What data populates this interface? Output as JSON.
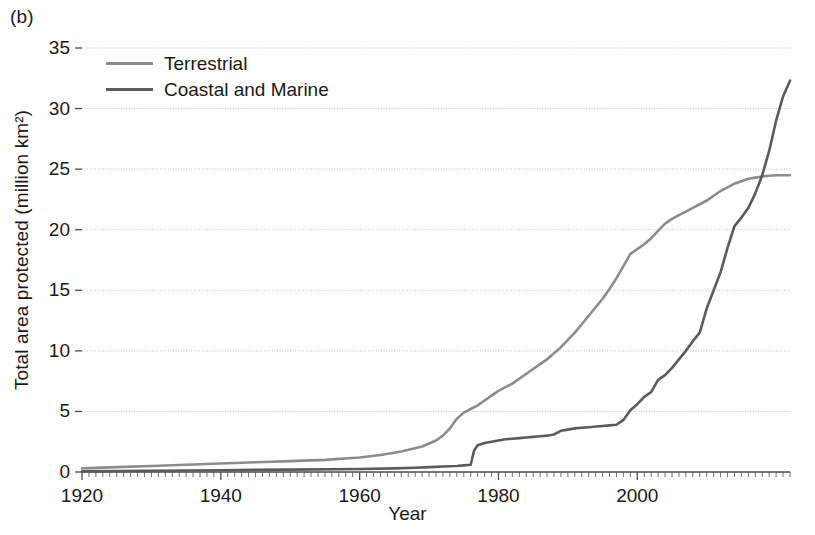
{
  "panel": {
    "label": "(b)"
  },
  "chart_data": {
    "type": "line",
    "title": "",
    "xlabel": "Year",
    "ylabel": "Total area protected (million km²)",
    "xlim": [
      1920,
      2022
    ],
    "ylim": [
      0,
      35
    ],
    "xticks": [
      1920,
      1940,
      1960,
      1980,
      2000
    ],
    "xtick_labels": [
      "1920",
      "1940",
      "1960",
      "1980",
      "2000"
    ],
    "yticks": [
      0,
      5,
      10,
      15,
      20,
      25,
      30,
      35
    ],
    "ytick_labels": [
      "0",
      "5",
      "10",
      "15",
      "20",
      "25",
      "30",
      "35"
    ],
    "grid": "horizontal",
    "legend_position": "top-left",
    "colors": {
      "terrestrial": "#8c8c8c",
      "coastal_marine": "#5b5b5b"
    },
    "series": [
      {
        "name": "Terrestrial",
        "color": "#8c8c8c",
        "x": [
          1920,
          1925,
          1930,
          1935,
          1940,
          1945,
          1950,
          1955,
          1960,
          1963,
          1966,
          1969,
          1971,
          1972,
          1973,
          1974,
          1975,
          1976,
          1977,
          1978,
          1979,
          1980,
          1981,
          1982,
          1983,
          1984,
          1985,
          1986,
          1987,
          1988,
          1989,
          1990,
          1991,
          1992,
          1993,
          1994,
          1995,
          1996,
          1997,
          1998,
          1999,
          2000,
          2001,
          2002,
          2003,
          2004,
          2005,
          2006,
          2007,
          2008,
          2009,
          2010,
          2011,
          2012,
          2013,
          2014,
          2015,
          2016,
          2017,
          2018,
          2019,
          2020,
          2021,
          2022
        ],
        "values": [
          0.3,
          0.4,
          0.5,
          0.6,
          0.7,
          0.8,
          0.9,
          1.0,
          1.2,
          1.4,
          1.7,
          2.1,
          2.6,
          3.0,
          3.6,
          4.4,
          4.9,
          5.2,
          5.5,
          5.9,
          6.3,
          6.7,
          7.0,
          7.3,
          7.7,
          8.1,
          8.5,
          8.9,
          9.3,
          9.8,
          10.3,
          10.9,
          11.5,
          12.2,
          12.9,
          13.6,
          14.3,
          15.1,
          16.0,
          17.0,
          18.0,
          18.4,
          18.8,
          19.3,
          19.9,
          20.5,
          20.9,
          21.2,
          21.5,
          21.8,
          22.1,
          22.4,
          22.8,
          23.2,
          23.5,
          23.8,
          24.0,
          24.2,
          24.3,
          24.4,
          24.45,
          24.5,
          24.5,
          24.5
        ]
      },
      {
        "name": "Coastal and Marine",
        "color": "#5b5b5b",
        "x": [
          1920,
          1930,
          1940,
          1950,
          1960,
          1965,
          1968,
          1970,
          1972,
          1974,
          1975,
          1976,
          1976.5,
          1977,
          1978,
          1979,
          1980,
          1981,
          1982,
          1983,
          1984,
          1985,
          1986,
          1987,
          1988,
          1989,
          1990,
          1991,
          1992,
          1993,
          1994,
          1995,
          1996,
          1997,
          1998,
          1999,
          2000,
          2001,
          2002,
          2003,
          2004,
          2005,
          2006,
          2007,
          2008,
          2009,
          2010,
          2011,
          2012,
          2013,
          2014,
          2015,
          2016,
          2017,
          2018,
          2019,
          2020,
          2021,
          2022
        ],
        "values": [
          0.05,
          0.1,
          0.15,
          0.2,
          0.25,
          0.3,
          0.35,
          0.4,
          0.45,
          0.5,
          0.55,
          0.6,
          1.8,
          2.2,
          2.4,
          2.5,
          2.6,
          2.7,
          2.75,
          2.8,
          2.85,
          2.9,
          2.95,
          3.0,
          3.1,
          3.4,
          3.5,
          3.6,
          3.65,
          3.7,
          3.75,
          3.8,
          3.85,
          3.9,
          4.3,
          5.1,
          5.6,
          6.2,
          6.6,
          7.6,
          8.0,
          8.6,
          9.3,
          10.0,
          10.8,
          11.5,
          13.5,
          15.0,
          16.5,
          18.5,
          20.3,
          21.0,
          21.8,
          23.0,
          24.5,
          26.5,
          29.0,
          31.0,
          32.3
        ]
      }
    ]
  }
}
